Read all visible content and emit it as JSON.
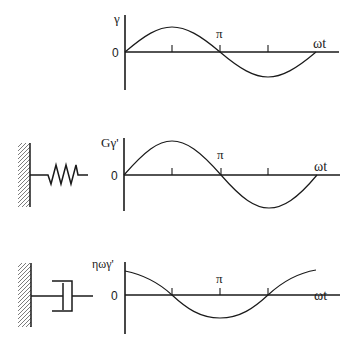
{
  "panels": [
    {
      "id": "strain",
      "y_label": "γ",
      "origin_label": "0",
      "pi_label": "π",
      "x_label": "ωt",
      "element": null,
      "waveform": "sin",
      "description": "Applied sinusoidal strain"
    },
    {
      "id": "elastic",
      "y_label": "Gγ'",
      "origin_label": "0",
      "pi_label": "π",
      "x_label": "ωt",
      "element": "spring",
      "waveform": "sin",
      "description": "Elastic (spring) stress response, in phase with strain"
    },
    {
      "id": "viscous",
      "y_label": "ηωγ'",
      "origin_label": "0",
      "pi_label": "π",
      "x_label": "ωt",
      "element": "dashpot",
      "waveform": "cos",
      "description": "Viscous (dashpot) stress response, 90° out of phase with strain"
    }
  ],
  "colors": {
    "line": "#1a1a1a",
    "background": "#ffffff"
  }
}
